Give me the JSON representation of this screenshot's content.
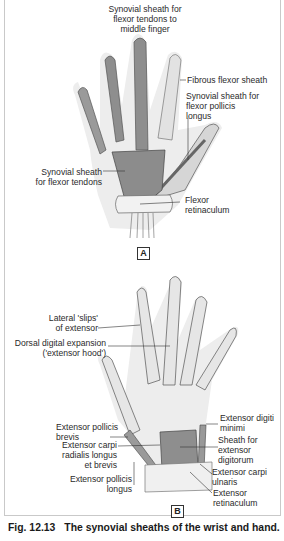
{
  "figure": {
    "number": "Fig. 12.13",
    "caption": "The synovial sheaths of the wrist and hand.",
    "colors": {
      "skin_halo": "#ececec",
      "bone": "#e4e4e4",
      "synovial_sheath": "#8f8f8f",
      "retinaculum": "#f1f1f1",
      "outline": "#444444"
    }
  },
  "panel_a": {
    "tag": "A",
    "view": "palmar",
    "labels": {
      "synovial_middle_1": "Synovial sheath for",
      "synovial_middle_2": "flexor tendons to",
      "synovial_middle_3": "middle finger",
      "fibrous_flexor": "Fibrous flexor sheath",
      "fpl_1": "Synovial sheath for",
      "fpl_2": "flexor pollicis",
      "fpl_3": "longus",
      "common_1": "Synovial sheath",
      "common_2": "for flexor tendons",
      "flexor_ret_1": "Flexor",
      "flexor_ret_2": "retinaculum"
    }
  },
  "panel_b": {
    "tag": "B",
    "view": "dorsal",
    "labels": {
      "lateral_slips_1": "Lateral 'slips'",
      "lateral_slips_2": "of extensor",
      "dorsal_exp_1": "Dorsal digital expansion",
      "dorsal_exp_2": "('extensor hood')",
      "epb_1": "Extensor pollicis",
      "epb_2": "brevis",
      "ecr_1": "Extensor carpi",
      "ecr_2": "radialis longus",
      "ecr_3": "et brevis",
      "epl_1": "Extensor pollicis",
      "epl_2": "longus",
      "edm_1": "Extensor digiti",
      "edm_2": "minimi",
      "ed_1": "Sheath for",
      "ed_2": "extensor",
      "ed_3": "digitorum",
      "ecu_1": "Extensor carpi",
      "ecu_2": "ulnaris",
      "ext_ret_1": "Extensor",
      "ext_ret_2": "retinaculum"
    }
  }
}
